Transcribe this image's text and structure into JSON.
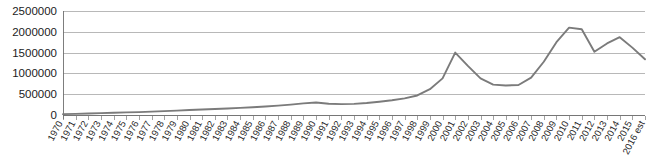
{
  "chart_data": {
    "type": "line",
    "title": "",
    "subtitle": "",
    "xlabel": "",
    "ylabel": "",
    "grid": "horizontal",
    "legend": "none",
    "xlim": [
      1970,
      2016
    ],
    "ylim": [
      0,
      2500000
    ],
    "ytick_labels": [
      "2500000",
      "2000000",
      "1500000",
      "1000000",
      "500000",
      "0"
    ],
    "ytick_values": [
      2500000,
      2000000,
      1500000,
      1000000,
      500000,
      0
    ],
    "categories": [
      "1970",
      "1971",
      "1972",
      "1973",
      "1974",
      "1975",
      "1976",
      "1977",
      "1978",
      "1979",
      "1980",
      "1981",
      "1982",
      "1983",
      "1984",
      "1985",
      "1986",
      "1987",
      "1988",
      "1989",
      "1990",
      "1991",
      "1992",
      "1993",
      "1994",
      "1995",
      "1996",
      "1997",
      "1998",
      "1999",
      "2000",
      "2001",
      "2002",
      "2003",
      "2004",
      "2005",
      "2006",
      "2007",
      "2008",
      "2009",
      "2010",
      "2011",
      "2012",
      "2013",
      "2014",
      "2015",
      "2016 est"
    ],
    "values": [
      20000,
      28000,
      36000,
      45000,
      55000,
      62000,
      70000,
      80000,
      92000,
      105000,
      120000,
      132000,
      145000,
      158000,
      172000,
      188000,
      205000,
      225000,
      250000,
      280000,
      300000,
      270000,
      262000,
      268000,
      290000,
      320000,
      355000,
      400000,
      470000,
      620000,
      880000,
      1500000,
      1180000,
      880000,
      730000,
      710000,
      720000,
      900000,
      1280000,
      1750000,
      2100000,
      2060000,
      1520000,
      1720000,
      1870000,
      1620000,
      1340000
    ],
    "series": [
      {
        "name": "",
        "color": "#7b7b7b",
        "values": [
          20000,
          28000,
          36000,
          45000,
          55000,
          62000,
          70000,
          80000,
          92000,
          105000,
          120000,
          132000,
          145000,
          158000,
          172000,
          188000,
          205000,
          225000,
          250000,
          280000,
          300000,
          270000,
          262000,
          268000,
          290000,
          320000,
          355000,
          400000,
          470000,
          620000,
          880000,
          1500000,
          1180000,
          880000,
          730000,
          710000,
          720000,
          900000,
          1280000,
          1750000,
          2100000,
          2060000,
          1520000,
          1720000,
          1870000,
          1620000,
          1340000
        ]
      }
    ],
    "colors": {
      "line": "#7b7b7b",
      "grid": "#9a9a9a",
      "axis": "#6f6f6f",
      "text": "#1c1c1c",
      "background": "#ffffff"
    },
    "geometry": {
      "plot_left": 63,
      "plot_right": 645,
      "plot_top": 11,
      "plot_bottom": 115,
      "xlabel_rotation": -62
    }
  }
}
